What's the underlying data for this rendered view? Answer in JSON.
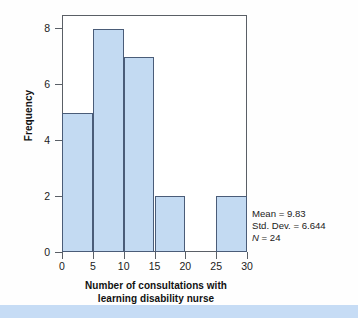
{
  "chart_data": {
    "type": "bar",
    "title": "",
    "subtitle": "",
    "xlabel_lines": [
      "Number of consultations with",
      "learning disability nurse"
    ],
    "xlabel": "Number of consultations with learning disability nurse",
    "ylabel": "Frequency",
    "categories": [
      "0-5",
      "5-10",
      "10-15",
      "15-20",
      "20-25",
      "25-30"
    ],
    "bin_edges": [
      0,
      5,
      10,
      15,
      20,
      25,
      30
    ],
    "values": [
      5,
      8,
      7,
      2,
      0,
      2
    ],
    "xlim": [
      0,
      30
    ],
    "ylim": [
      0,
      8.5
    ],
    "x_ticks": [
      "0",
      "5",
      "10",
      "15",
      "20",
      "25",
      "30"
    ],
    "x_tick_values": [
      0,
      5,
      10,
      15,
      20,
      25,
      30
    ],
    "y_ticks": [
      "0",
      "2",
      "4",
      "6",
      "8"
    ],
    "y_tick_values": [
      0,
      2,
      4,
      6,
      8
    ],
    "grid": false,
    "legend": false,
    "bar_fill_color": "#c3daf2",
    "bar_edge_color": "#4a5c78",
    "axis_color": "#5a5f66"
  },
  "annotation": {
    "mean_line": "Mean = 9.83",
    "std_line": "Std. Dev. = 6.644",
    "n_symbol": "N",
    "n_value": " = 24"
  },
  "decor": {
    "band_color": "#c6dcf5"
  }
}
